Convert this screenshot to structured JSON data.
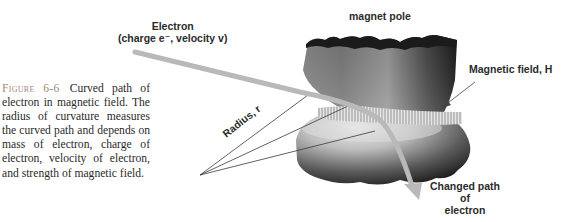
{
  "figure": {
    "number_label": "Figure 6-6",
    "caption": "Curved path of electron in magnetic field. The radius of curvature measures the curved path and depends on mass of electron, charge of electron, velocity of electron, and strength of magnetic field.",
    "labels": {
      "electron_line1": "Electron",
      "electron_line2": "(charge e⁻, velocity v)",
      "magnet_pole": "magnet pole",
      "magnetic_field": "Magnetic field, H",
      "radius": "Radius, r",
      "changed_path_line1": "Changed path",
      "changed_path_line2": "of",
      "changed_path_line3": "electron"
    },
    "colors": {
      "path_arrow": "#b9b9b9",
      "pole_dark": "#1e1e1e",
      "pole_mid": "#6e6e6e",
      "pole_light": "#d6d6d6",
      "caption_label": "#9a8b80",
      "caption_text": "#2a2a2a"
    }
  }
}
